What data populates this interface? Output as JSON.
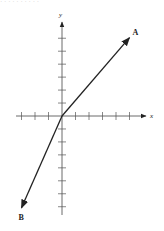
{
  "header": {
    "text": "· · ·   ·  · · · · · ·"
  },
  "diagram": {
    "type": "vector-diagram",
    "axes": {
      "x_label": "x",
      "y_label": "y",
      "origin_px": [
        62,
        116
      ],
      "tick_spacing_px": 13.5,
      "x_ticks_left": 3,
      "x_ticks_right": 5,
      "y_ticks_up": 6,
      "y_ticks_down": 7
    },
    "vectors": [
      {
        "label": "A",
        "from_units": [
          0,
          0
        ],
        "to_units": [
          5,
          5.8
        ],
        "direction": "up-right"
      },
      {
        "label": "B",
        "from_units": [
          0,
          0
        ],
        "to_units": [
          -3,
          -6.8
        ],
        "direction": "down-left"
      }
    ],
    "colors": {
      "ink": "#222222",
      "background": "#ffffff"
    }
  }
}
